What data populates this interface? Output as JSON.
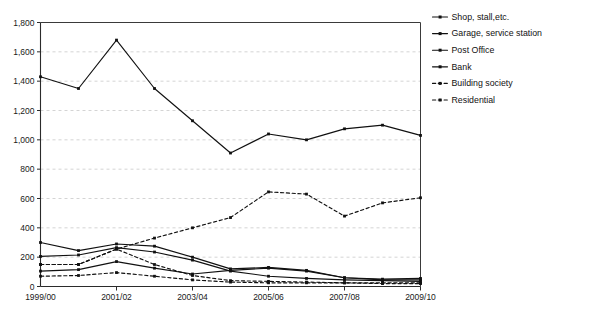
{
  "chart_data": {
    "type": "line",
    "title": "",
    "subtitle": "",
    "xlabel": "",
    "ylabel": "",
    "grid": "horizontal",
    "legend_position": "right",
    "ylim": [
      0,
      1800
    ],
    "ytick_step": 200,
    "yticks": [
      "0",
      "200",
      "400",
      "600",
      "800",
      "1,000",
      "1,200",
      "1,400",
      "1,600",
      "1,800"
    ],
    "ytick_values": [
      0,
      200,
      400,
      600,
      800,
      1000,
      1200,
      1400,
      1600,
      1800
    ],
    "x": [
      "1999/00",
      "2000/01",
      "2001/02",
      "2002/03",
      "2003/04",
      "2004/05",
      "2005/06",
      "2006/07",
      "2007/08",
      "2008/09",
      "2009/10"
    ],
    "xticks_shown": [
      "1999/00",
      "2001/02",
      "2003/04",
      "2005/06",
      "2007/08",
      "2009/10"
    ],
    "series": [
      {
        "name": "Shop, stall,etc.",
        "style": "solid",
        "marker": "dot",
        "values": [
          1430,
          1350,
          1680,
          1350,
          1130,
          910,
          1040,
          1000,
          1075,
          1100,
          1030
        ]
      },
      {
        "name": "Garage, service station",
        "style": "solid",
        "marker": "dot",
        "values": [
          300,
          245,
          290,
          275,
          200,
          120,
          130,
          110,
          60,
          50,
          55
        ]
      },
      {
        "name": "Post Office",
        "style": "solid",
        "marker": "dot",
        "values": [
          205,
          215,
          265,
          235,
          180,
          105,
          70,
          55,
          45,
          40,
          35
        ]
      },
      {
        "name": "Bank",
        "style": "solid",
        "marker": "dot",
        "values": [
          105,
          115,
          170,
          125,
          85,
          110,
          125,
          105,
          60,
          45,
          45
        ]
      },
      {
        "name": "Building society",
        "style": "dashed",
        "marker": "dot",
        "values": [
          150,
          150,
          255,
          150,
          75,
          40,
          35,
          30,
          25,
          20,
          20
        ]
      },
      {
        "name": "Residential",
        "style": "dashed",
        "marker": "dot",
        "values": [
          70,
          75,
          95,
          70,
          45,
          30,
          25,
          25,
          25,
          25,
          25
        ]
      },
      {
        "name": "Residential-upper",
        "style": "dashed",
        "marker": "dot",
        "values": [
          150,
          150,
          255,
          330,
          400,
          470,
          645,
          630,
          480,
          570,
          605
        ]
      }
    ],
    "plotted_series_order": [
      "Shop, stall,etc.",
      "Garage, service station",
      "Post Office",
      "Bank",
      "Building society",
      "Residential"
    ]
  },
  "legend": {
    "items": [
      {
        "label": "Shop, stall,etc.",
        "style": "solid"
      },
      {
        "label": "Garage, service station",
        "style": "solid"
      },
      {
        "label": "Post Office",
        "style": "solid"
      },
      {
        "label": "Bank",
        "style": "solid"
      },
      {
        "label": "Building society",
        "style": "dashed"
      },
      {
        "label": "Residential",
        "style": "dashed"
      }
    ]
  },
  "colors": {
    "line": "#111111",
    "grid": "#c9c9c9",
    "axis": "#2b2b2b",
    "background": "#ffffff",
    "text": "#1a1a1a"
  }
}
